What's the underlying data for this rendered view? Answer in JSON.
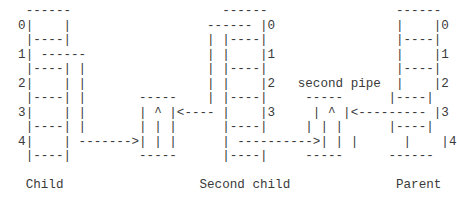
{
  "diagram": {
    "type": "ascii-art",
    "lines": [
      "   ------                    ------                 ------",
      "  0|    |                  ------ |0                |    |0",
      "   |----|                  | |----|                 |----|",
      "  1| ------                | |    |1                |    |1",
      "   |----| |                | |----|                 |----|",
      "  2|    | |                | |    |2   second pipe  |    |2",
      "   |----| |       -----    | |----|     -----      |----|",
      "  3|    | |       | ^ |<---- |    |3     | ^ |<--------- |3",
      "   |----| |       | | |      |----|     | | |      |----|",
      "  4|    | ------->| | |      | ---------->| | |      |    |4",
      "   |----|         -----      |----|     -----      ------",
      "",
      "   Child                  Second child              Parent"
    ],
    "labels": {
      "child": "Child",
      "second_child": "Second child",
      "parent": "Parent",
      "second_pipe": "second pipe"
    },
    "slot_indices": [
      "0",
      "1",
      "2",
      "3",
      "4"
    ],
    "pipe_symbol": "^"
  }
}
